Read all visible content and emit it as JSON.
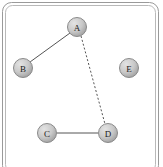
{
  "canvas": {
    "width": 163,
    "height": 167,
    "background": "#ffffff"
  },
  "frame": {
    "name": "rounded-panel-border",
    "outer": {
      "x": 2.5,
      "y": 2.5,
      "width": 156,
      "height": 172,
      "radius": 9
    },
    "inner": {
      "x": 5.5,
      "y": 5.5,
      "width": 150,
      "height": 166,
      "radius": 7
    },
    "stroke_outer": "#9a9a9a",
    "stroke_inner": "#b9b9b9",
    "stroke_width": 1
  },
  "graph": {
    "title": "Node link diagram",
    "node_radius": 9.5,
    "node_fill_light": "#d8d8d8",
    "node_fill_dark": "#a3a3a3",
    "node_stroke": "#8a8a8a",
    "label_color": "#1a1a1a",
    "edge_color": "#555555",
    "nodes": [
      {
        "id": "A",
        "label": "A",
        "x": 77,
        "y": 27
      },
      {
        "id": "B",
        "label": "B",
        "x": 23,
        "y": 68
      },
      {
        "id": "C",
        "label": "C",
        "x": 47,
        "y": 133
      },
      {
        "id": "D",
        "label": "D",
        "x": 108,
        "y": 133
      },
      {
        "id": "E",
        "label": "E",
        "x": 129,
        "y": 68
      }
    ],
    "edges": [
      {
        "id": "A-B",
        "source": "A",
        "target": "B",
        "style": "solid",
        "x1": 70,
        "y1": 33,
        "x2": 30,
        "y2": 62
      },
      {
        "id": "A-D",
        "source": "A",
        "target": "D",
        "style": "dashed",
        "x1": 81,
        "y1": 36,
        "x2": 105,
        "y2": 124
      },
      {
        "id": "C-D",
        "source": "C",
        "target": "D",
        "style": "solid",
        "x1": 57,
        "y1": 133,
        "x2": 98,
        "y2": 133
      }
    ]
  }
}
